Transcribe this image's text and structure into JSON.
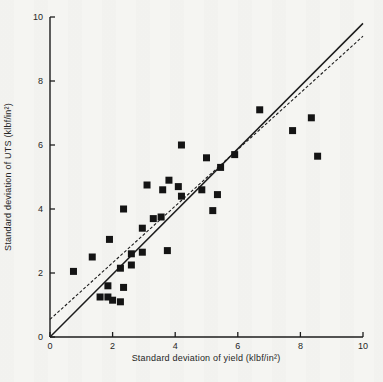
{
  "page": {
    "header": "MECHANICAL RELIABILITY AND DESIGN",
    "background_color": "#f5f5f2",
    "ink_color": "#1c1c1c"
  },
  "chart_data": {
    "type": "scatter",
    "title": "",
    "xlabel": "Standard deviation of yield (klbf/in²)",
    "ylabel": "Standard deviation of UTS (klbf/in²)",
    "xlim": [
      0,
      10
    ],
    "ylim": [
      0,
      10
    ],
    "x_ticks": [
      0,
      2,
      4,
      6,
      8,
      10
    ],
    "y_ticks": [
      0,
      2,
      4,
      6,
      8,
      10
    ],
    "grid": false,
    "legend": "none",
    "marker": "filled-square",
    "marker_size_px": 7,
    "marker_color": "#141414",
    "points": [
      [
        0.75,
        2.05
      ],
      [
        1.35,
        2.5
      ],
      [
        1.6,
        1.25
      ],
      [
        1.85,
        1.6
      ],
      [
        1.85,
        1.25
      ],
      [
        1.9,
        3.05
      ],
      [
        2.0,
        1.15
      ],
      [
        2.25,
        1.1
      ],
      [
        2.25,
        2.15
      ],
      [
        2.35,
        1.55
      ],
      [
        2.35,
        4.0
      ],
      [
        2.6,
        2.25
      ],
      [
        2.6,
        2.6
      ],
      [
        2.95,
        2.65
      ],
      [
        2.95,
        3.4
      ],
      [
        3.1,
        4.75
      ],
      [
        3.3,
        3.7
      ],
      [
        3.55,
        3.75
      ],
      [
        3.6,
        4.6
      ],
      [
        3.75,
        2.7
      ],
      [
        3.8,
        4.9
      ],
      [
        4.1,
        4.7
      ],
      [
        4.2,
        4.4
      ],
      [
        4.2,
        6.0
      ],
      [
        4.85,
        4.6
      ],
      [
        5.0,
        5.6
      ],
      [
        5.2,
        3.95
      ],
      [
        5.35,
        4.45
      ],
      [
        5.45,
        5.3
      ],
      [
        5.9,
        5.7
      ],
      [
        6.7,
        7.1
      ],
      [
        7.75,
        6.45
      ],
      [
        8.35,
        6.85
      ],
      [
        8.55,
        5.65
      ]
    ],
    "lines": [
      {
        "name": "equality-line",
        "style": "solid",
        "from": [
          0,
          0
        ],
        "to": [
          10,
          9.8
        ],
        "width": 1.5
      },
      {
        "name": "fit-line",
        "style": "dashed",
        "from": [
          0,
          0.55
        ],
        "to": [
          10,
          9.4
        ],
        "width": 1.1
      }
    ]
  }
}
